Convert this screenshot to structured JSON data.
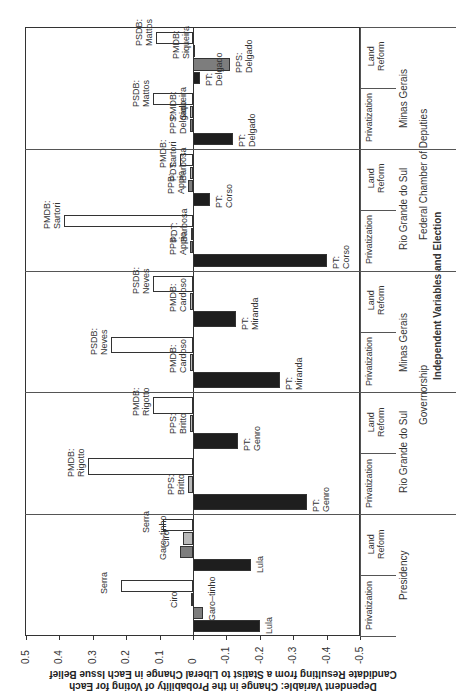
{
  "chart_data": {
    "type": "bar",
    "orientation": "rotated 90deg counter-clockwise; value axis horizontal (positive to the left)",
    "ylabel": "Dependent Variable: Change in the Probability of Voting for Each Candidate Resulting from a Statist to Liberal Change in Each Issue Belief",
    "xlabel": "Independent Variables and Election",
    "ylim": [
      -0.5,
      0.5
    ],
    "ticks": [
      "0.5",
      "0.4",
      "0.3",
      "0.2",
      "0.1",
      "0",
      "-0.1",
      "-0.2",
      "-0.3",
      "-0.4",
      "-0.5"
    ],
    "grid": false,
    "legend": "none (candidates labeled directly on bars)",
    "bar_colors": {
      "PT": "#1e1e1e",
      "secondary_gray_dark": "#7d7d7d",
      "secondary_gray_light": "#b9b9b9",
      "right_party": "#ffffff"
    },
    "panels": [
      {
        "election": "Presidency",
        "level": "Presidency",
        "groups": [
          {
            "issue": "Privatization",
            "bars": [
              {
                "label": "Lula",
                "value": -0.2,
                "color": "black"
              },
              {
                "label": "Garo–tinho",
                "value": -0.03,
                "color": "dgray"
              },
              {
                "label": "Ciro",
                "value": 0.005,
                "color": "lgray"
              },
              {
                "label": "Serra",
                "value": 0.215,
                "color": "white"
              }
            ]
          },
          {
            "issue": "Land Reform",
            "bars": [
              {
                "label": "Lula",
                "value": -0.175,
                "color": "black"
              },
              {
                "label": "Garo–tinho",
                "value": 0.04,
                "color": "dgray"
              },
              {
                "label": "Ciro",
                "value": 0.03,
                "color": "lgray"
              },
              {
                "label": "Serra",
                "value": 0.09,
                "color": "white"
              }
            ]
          }
        ]
      },
      {
        "election": "Rio Grande do Sul",
        "level": "Governorship",
        "groups": [
          {
            "issue": "Privatization",
            "bars": [
              {
                "label": "PT: Genro",
                "value": -0.34,
                "color": "black"
              },
              {
                "label": "PPS: Britto",
                "value": 0.015,
                "color": "lgray"
              },
              {
                "label": "PMDB: Rigotto",
                "value": 0.315,
                "color": "white"
              }
            ]
          },
          {
            "issue": "Land Reform",
            "bars": [
              {
                "label": "PT: Genro",
                "value": -0.135,
                "color": "black"
              },
              {
                "label": "PPS: Britto",
                "value": 0.01,
                "color": "lgray"
              },
              {
                "label": "PMDB: Rigotto",
                "value": 0.12,
                "color": "white"
              }
            ]
          }
        ]
      },
      {
        "election": "Minas Gerais",
        "level": "Governorship",
        "groups": [
          {
            "issue": "Privatization",
            "bars": [
              {
                "label": "PT: Miranda",
                "value": -0.26,
                "color": "black"
              },
              {
                "label": "PMDB: Cardoso",
                "value": 0.01,
                "color": "lgray"
              },
              {
                "label": "PSDB: Neves",
                "value": 0.245,
                "color": "white"
              }
            ]
          },
          {
            "issue": "Land Reform",
            "bars": [
              {
                "label": "PT: Miranda",
                "value": -0.13,
                "color": "black"
              },
              {
                "label": "PMDB: Cardoso",
                "value": 0.01,
                "color": "lgray"
              },
              {
                "label": "PSDB: Neves",
                "value": 0.12,
                "color": "white"
              }
            ]
          }
        ]
      },
      {
        "election": "Rio Grande do Sul",
        "level": "Federal Chamber of Deputies",
        "groups": [
          {
            "issue": "Privatization",
            "bars": [
              {
                "label": "PT: Corso",
                "value": -0.4,
                "color": "black"
              },
              {
                "label": "PPB: Appio",
                "value": 0.01,
                "color": "dgray"
              },
              {
                "label": "PDT: Barbosa",
                "value": 0.005,
                "color": "lgray"
              },
              {
                "label": "PMDB: Sartori",
                "value": 0.385,
                "color": "white"
              }
            ]
          },
          {
            "issue": "Land Reform",
            "bars": [
              {
                "label": "PT: Corso",
                "value": -0.05,
                "color": "black"
              },
              {
                "label": "PPB: Appio",
                "value": 0.015,
                "color": "dgray"
              },
              {
                "label": "PDT: Barbosa",
                "value": 0.01,
                "color": "lgray"
              },
              {
                "label": "PMDB: Sartori",
                "value": 0.04,
                "color": "white"
              }
            ]
          }
        ]
      },
      {
        "election": "Minas Gerais",
        "level": "Federal Chamber of Deputies",
        "groups": [
          {
            "issue": "Privatization",
            "bars": [
              {
                "label": "PT: Delgado",
                "value": -0.12,
                "color": "black"
              },
              {
                "label": "PPS: Delgado",
                "value": 0.01,
                "color": "dgray"
              },
              {
                "label": "PMDB: Siqueira",
                "value": 0.01,
                "color": "lgray"
              },
              {
                "label": "PSDB: Mattos",
                "value": 0.12,
                "color": "white"
              }
            ]
          },
          {
            "issue": "Land Reform",
            "bars": [
              {
                "label": "PT: Delgado",
                "value": -0.02,
                "color": "black"
              },
              {
                "label": "PPS: Delgado",
                "value": -0.11,
                "color": "dgray"
              },
              {
                "label": "PMDB: Siqueira",
                "value": 0.0,
                "color": "lgray"
              },
              {
                "label": "PSDB: Mattos",
                "value": 0.11,
                "color": "white"
              }
            ]
          }
        ]
      }
    ]
  },
  "labels": {
    "ylabel_line1": "Dependent Variable: Change in the Probability of Voting for Each",
    "ylabel_line2": "Candidate Resulting from a Statist to Liberal Change in Each Issue Belief",
    "xlabel": "Independent Variables and Election",
    "level_presidency": "Presidency",
    "level_governorship": "Governorship",
    "level_federal": "Federal Chamber of Deputies",
    "state_rgs": "Rio Grande do Sul",
    "state_mg": "Minas Gerais",
    "issue_priv": "Privatization",
    "issue_land_1": "Land",
    "issue_land_2": "Reform"
  }
}
